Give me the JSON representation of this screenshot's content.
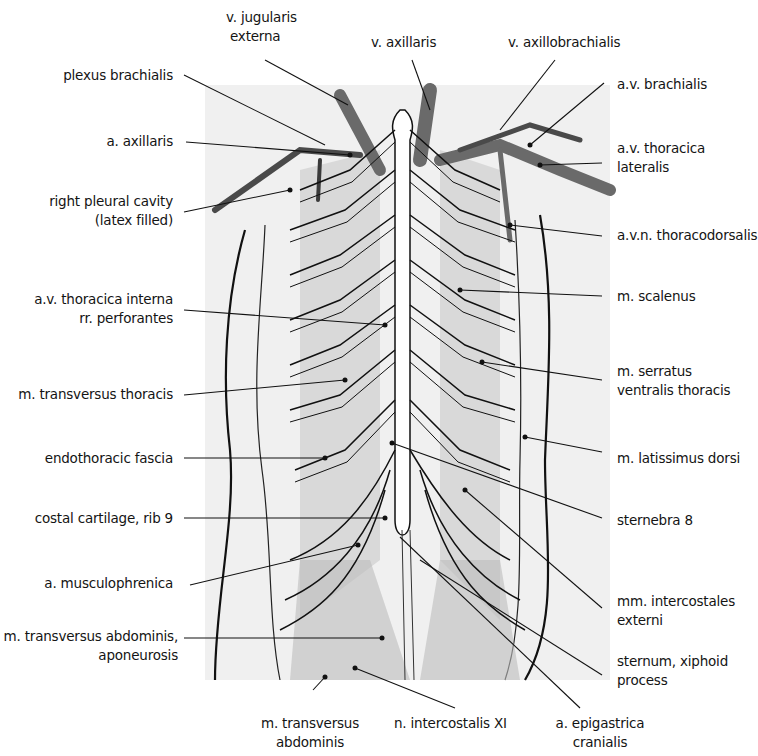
{
  "figure": {
    "colors": {
      "background": "#ffffff",
      "line": "#111111",
      "vessel_dark": "#4a4a4a",
      "vessel_mid": "#7a7a7a",
      "muscle_shade": "#c8c8c8",
      "panel_shade": "#efefef",
      "bone": "#ffffff"
    }
  },
  "labels": {
    "left": [
      {
        "id": "plexus-brachialis",
        "lines": [
          "plexus brachialis"
        ]
      },
      {
        "id": "a-axillaris",
        "lines": [
          "a. axillaris"
        ]
      },
      {
        "id": "right-pleural-cavity",
        "lines": [
          "right pleural cavity",
          "(latex filled)"
        ]
      },
      {
        "id": "av-thoracica-interna",
        "lines": [
          "a.v. thoracica interna",
          "rr. perforantes"
        ]
      },
      {
        "id": "m-transversus-thoracis",
        "lines": [
          "m. transversus thoracis"
        ]
      },
      {
        "id": "endothoracic-fascia",
        "lines": [
          "endothoracic fascia"
        ]
      },
      {
        "id": "costal-cartilage-rib-9",
        "lines": [
          "costal cartilage, rib 9"
        ]
      },
      {
        "id": "a-musculophrenica",
        "lines": [
          "a. musculophrenica"
        ]
      },
      {
        "id": "m-transversus-abdominis-aponeurosis",
        "lines": [
          "m. transversus abdominis,",
          "aponeurosis"
        ]
      }
    ],
    "top": [
      {
        "id": "v-jugularis-externa",
        "lines": [
          "v. jugularis",
          "externa"
        ]
      },
      {
        "id": "v-axillaris",
        "lines": [
          "v. axillaris"
        ]
      },
      {
        "id": "v-axillobrachialis",
        "lines": [
          "v. axillobrachialis"
        ]
      }
    ],
    "right": [
      {
        "id": "av-brachialis",
        "lines": [
          "a.v. brachialis"
        ]
      },
      {
        "id": "av-thoracica-lateralis",
        "lines": [
          "a.v. thoracica",
          "lateralis"
        ]
      },
      {
        "id": "avn-thoracodorsalis",
        "lines": [
          "a.v.n. thoracodorsalis"
        ]
      },
      {
        "id": "m-scalenus",
        "lines": [
          "m. scalenus"
        ]
      },
      {
        "id": "m-serratus-ventralis",
        "lines": [
          "m. serratus",
          "ventralis thoracis"
        ]
      },
      {
        "id": "m-latissimus-dorsi",
        "lines": [
          "m. latissimus dorsi"
        ]
      },
      {
        "id": "sternebra-8",
        "lines": [
          "sternebra 8"
        ]
      },
      {
        "id": "mm-intercostales-externi",
        "lines": [
          "mm. intercostales",
          "externi"
        ]
      },
      {
        "id": "sternum-xiphoid",
        "lines": [
          "sternum, xiphoid",
          "process"
        ]
      }
    ],
    "bottom": [
      {
        "id": "m-transversus-abdominis",
        "lines": [
          "m. transversus",
          "abdominis"
        ]
      },
      {
        "id": "n-intercostalis-xi",
        "lines": [
          "n. intercostalis XI"
        ]
      },
      {
        "id": "a-epigastrica-cranialis",
        "lines": [
          "a. epigastrica",
          "cranialis"
        ]
      }
    ]
  }
}
